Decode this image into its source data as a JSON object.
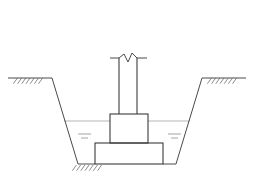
{
  "drawing": {
    "title": "Spread Footing Foundation Cross-Section in Excavated Trench",
    "type": "engineering-cross-section",
    "canvas": {
      "width": 253,
      "height": 191,
      "background": "#ffffff"
    },
    "colors": {
      "structure_line": "#3b3b3b",
      "ground_line": "#4a4a4a",
      "hatch_line": "#5a5a5a",
      "water_line": "#b4b4b4",
      "water_tick": "#9a9a9a",
      "break_line": "#4a4a4a"
    },
    "line_weights": {
      "structure": 1.1,
      "ground": 1.0,
      "hatch": 0.7,
      "water": 1.0,
      "water_tick": 0.9
    },
    "elements": {
      "ground_line_left": {
        "label": "Existing Grade (Left)",
        "points": "8,78 52,78"
      },
      "ground_line_right": {
        "label": "Existing Grade (Right)",
        "points": "202,78 246,78"
      },
      "trench_slope_left": {
        "label": "Excavation Side Slope (Left)",
        "points": "52,78 78,164"
      },
      "trench_slope_right": {
        "label": "Excavation Side Slope (Right)",
        "points": "176,164 202,78"
      },
      "trench_bottom_left": {
        "label": "Excavation Bottom (Left)",
        "points": "78,164 95,164"
      },
      "trench_bottom_right": {
        "label": "Excavation Bottom (Right)",
        "points": "163,164 176,164"
      },
      "footing": {
        "label": "Spread Footing Base",
        "x": 95,
        "y": 143,
        "width": 68,
        "height": 21
      },
      "pedestal": {
        "label": "Footing Pedestal",
        "x": 110,
        "y": 114,
        "width": 38,
        "height": 29
      },
      "column_left_face": {
        "label": "Column Left Face",
        "points": "119,58 119,114"
      },
      "column_right_face": {
        "label": "Column Right Face",
        "points": "137,58 137,114"
      },
      "water_table_line_left": {
        "label": "Groundwater Table (Left)",
        "points": "64,121 110,121"
      },
      "water_table_line_right": {
        "label": "Groundwater Table (Right)",
        "points": "148,121 190,121"
      }
    },
    "hatch_groups": {
      "ground_hatch_left": {
        "label": "Grade Hatching (Left)",
        "anchor_x": 30,
        "anchor_y": 78,
        "count": 7,
        "spacing": 4.2,
        "length": 7,
        "angle_deg": 55
      },
      "ground_hatch_right": {
        "label": "Grade Hatching (Right)",
        "anchor_x": 224,
        "anchor_y": 78,
        "count": 7,
        "spacing": 4.2,
        "length": 7,
        "angle_deg": 55
      },
      "bottom_hatch": {
        "label": "Excavation Bottom Hatching",
        "anchor_x": 89,
        "anchor_y": 165,
        "count": 7,
        "spacing": 4.2,
        "length": 7,
        "angle_deg": 55
      }
    },
    "break_symbol": {
      "label": "Column Break Line Symbol",
      "tick_left": "110,58 119,58",
      "tick_right": "137,58 147,58",
      "zigzag": "119,58 124,54 128,62 132,53 137,58"
    },
    "water_marks_left": {
      "label": "Water Surface Marks (Left)",
      "dashes": [
        {
          "x1": 78,
          "y1": 134,
          "x2": 91,
          "y2": 134
        },
        {
          "x1": 81,
          "y1": 138,
          "x2": 88,
          "y2": 138
        }
      ]
    },
    "water_marks_right": {
      "label": "Water Surface Marks (Right)",
      "dashes": [
        {
          "x1": 168,
          "y1": 134,
          "x2": 181,
          "y2": 134
        },
        {
          "x1": 171,
          "y1": 138,
          "x2": 178,
          "y2": 138
        }
      ]
    }
  }
}
